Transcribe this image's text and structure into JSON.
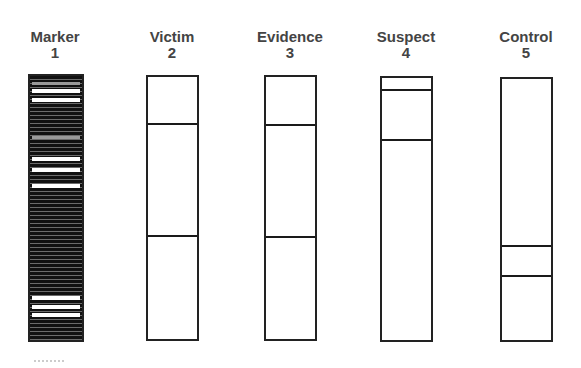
{
  "figure": {
    "type": "gel-electrophoresis-diagram",
    "lanes": [
      {
        "name": "Marker",
        "number": "1",
        "type": "ladder"
      },
      {
        "name": "Victim",
        "number": "2",
        "bands_y": [
          123,
          235
        ]
      },
      {
        "name": "Evidence",
        "number": "3",
        "bands_y": [
          124,
          236
        ]
      },
      {
        "name": "Suspect",
        "number": "4",
        "bands_y": [
          89,
          139
        ]
      },
      {
        "name": "Control",
        "number": "5",
        "bands_y": [
          245,
          275
        ]
      }
    ],
    "colors": {
      "lane_border": "#222222",
      "band": "#1a1a1a",
      "label_text": "#444444",
      "ladder_fill": "#111111"
    }
  }
}
